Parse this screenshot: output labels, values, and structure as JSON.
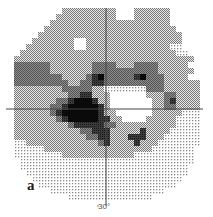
{
  "figure": {
    "panel_label": "a",
    "axis_tick_label": "30°",
    "colors": {
      "level_0": "#ffffff",
      "level_1": "#d9d9d9",
      "level_2": "#a8a8a8",
      "level_3": "#6e6e6e",
      "level_4": "#3c3c3c",
      "level_5": "#0a0a0a",
      "axis": "#444444"
    },
    "grid": {
      "origin_x": 8,
      "origin_y": 8,
      "cell": 6,
      "cols": 32,
      "rows": 32,
      "center_x": 106,
      "center_y": 109,
      "legend": "0=white, 1=sparse dots, 2=medium checker, 3=dark grey, 4=darker, 5=black, -1=outside field",
      "levels": [
        "---------222222222000222222------",
        "--------2222222222000222222------",
        "-------22222222222222222222------",
        "------2222222222222222222222-----",
        "-----222222222222222222222222----",
        "----2222222002222222222222222----",
        "---22222222002222222222222211---",
        "--2222222222222222222222222211--",
        "-222222222222222222222222222222-",
        "-33333322222223333222333322222-",
        "-333333222222233333333333222222-",
        "-33333333222234533333453332222-",
        "-3333333332233443333333333222222",
        "-22222222333332211111113332222222",
        "-2222222223344222000000222332222",
        "-2222222334555422000000022342222",
        "-2222223345555542000000022332222",
        "-2222223455555542200000022222111",
        "-2222222345555544220000222221111",
        "-22222222234444433222222222211111",
        "-22222222222334442222242222111111",
        "-2222222222223344222444222111111",
        "-1122222222222234222242221111111",
        "-111112222222222222222221111111-",
        "-111111112222222222221111111111-",
        "--11111111111111111111111111111-",
        "--1111111111111111111111111111--",
        "---111111111111111111111111111--",
        "----1111111111111111111111111---",
        "-----11111111111111111111111----",
        "-------1111111111111111111------",
        "----------11111111111111--------"
      ]
    }
  }
}
